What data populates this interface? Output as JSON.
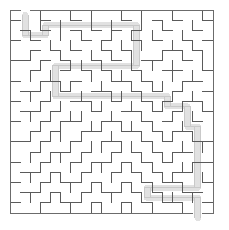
{
  "figure": {
    "kind": "maze-puzzle",
    "background_color": "#ffffff",
    "wall_color": "#5a5a5a",
    "solution_color": "#c9c9c9",
    "border_color": "#6b6b6b"
  },
  "maze": {
    "columns": 20,
    "rows": 20,
    "cell_size": 10.15,
    "origin_x": 10,
    "origin_y": 10,
    "width_px": 203,
    "height_px": 203,
    "wall_thickness": 1,
    "solution_thickness": 1,
    "entrance": {
      "side": "top",
      "cell": 1
    },
    "exit": {
      "side": "bottom",
      "cell": 18
    },
    "h_walls": [
      "11111111111111111111",
      "10010010000100101001",
      "01010010101010010010",
      "10100001010010100101",
      "00101010010100011010",
      "11010100101001100100",
      "00100101010010011001",
      "10011010001101000110",
      "01100100110010101001",
      "10010011001001010110",
      "01101000100110101001",
      "10010110011001010010",
      "00101001100110101100",
      "11010010011001010011",
      "00101101001010101100",
      "10010010110101010011",
      "01101001001010101100",
      "10010110100101011001",
      "01101001011010100110",
      "10010110100101011001",
      "11111111111111111111"
    ],
    "v_walls": [
      "100100101001010010011",
      "100101001010010100101",
      "101001010010101001001",
      "100010100101010010101",
      "101001001010100101011",
      "100100110100101010011",
      "101010001011010010101",
      "100101100100101101001",
      "101010010011010010101",
      "100101001100101101011",
      "101010110010010010101",
      "100101001101101001001",
      "101011010010010110101",
      "100100101101101001011",
      "101011010010010110001",
      "100100101101101001101",
      "101011010010010110011",
      "100100101101101001001",
      "101011010010010110101",
      "100100101101101001001"
    ],
    "solution_path": [
      [
        1,
        0
      ],
      [
        1,
        1
      ],
      [
        1,
        2
      ],
      [
        2,
        2
      ],
      [
        3,
        2
      ],
      [
        3,
        1
      ],
      [
        4,
        1
      ],
      [
        5,
        1
      ],
      [
        6,
        1
      ],
      [
        7,
        1
      ],
      [
        8,
        1
      ],
      [
        9,
        1
      ],
      [
        10,
        1
      ],
      [
        11,
        1
      ],
      [
        12,
        1
      ],
      [
        12,
        2
      ],
      [
        12,
        3
      ],
      [
        12,
        4
      ],
      [
        12,
        5
      ],
      [
        11,
        5
      ],
      [
        10,
        5
      ],
      [
        9,
        5
      ],
      [
        8,
        5
      ],
      [
        7,
        5
      ],
      [
        6,
        5
      ],
      [
        5,
        5
      ],
      [
        4,
        5
      ],
      [
        4,
        6
      ],
      [
        4,
        7
      ],
      [
        4,
        8
      ],
      [
        5,
        8
      ],
      [
        6,
        8
      ],
      [
        7,
        8
      ],
      [
        8,
        8
      ],
      [
        9,
        8
      ],
      [
        10,
        8
      ],
      [
        11,
        8
      ],
      [
        12,
        8
      ],
      [
        13,
        8
      ],
      [
        14,
        8
      ],
      [
        15,
        8
      ],
      [
        15,
        9
      ],
      [
        16,
        9
      ],
      [
        17,
        9
      ],
      [
        17,
        10
      ],
      [
        17,
        11
      ],
      [
        18,
        11
      ],
      [
        18,
        12
      ],
      [
        18,
        13
      ],
      [
        18,
        14
      ],
      [
        18,
        15
      ],
      [
        18,
        16
      ],
      [
        18,
        17
      ],
      [
        17,
        17
      ],
      [
        16,
        17
      ],
      [
        15,
        17
      ],
      [
        14,
        17
      ],
      [
        13,
        17
      ],
      [
        13,
        18
      ],
      [
        14,
        18
      ],
      [
        15,
        18
      ],
      [
        16,
        18
      ],
      [
        17,
        18
      ],
      [
        18,
        18
      ],
      [
        18,
        19
      ],
      [
        18,
        20
      ]
    ]
  }
}
